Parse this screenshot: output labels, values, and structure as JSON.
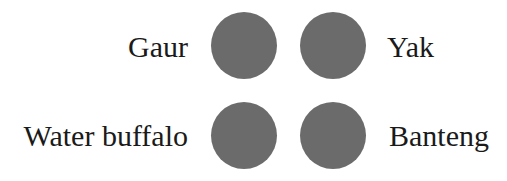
{
  "diagram": {
    "dot_color": "#6b6b6b",
    "items": [
      {
        "label": "Gaur",
        "position": "top-left"
      },
      {
        "label": "Yak",
        "position": "top-right"
      },
      {
        "label": "Water buffalo",
        "position": "bottom-left"
      },
      {
        "label": "Banteng",
        "position": "bottom-right"
      }
    ]
  }
}
